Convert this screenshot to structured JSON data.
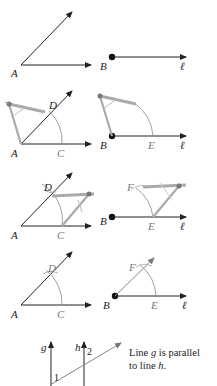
{
  "diagram": {
    "steps": [
      {
        "step": 1,
        "left": {
          "vertex": "A",
          "description": "Given angle A"
        },
        "right": {
          "point": "B",
          "line": "ℓ",
          "description": "Point B on line ℓ"
        }
      },
      {
        "step": 2,
        "left": {
          "labels": [
            "A",
            "C",
            "D"
          ],
          "description": "Compass arc centered at A intersecting rays at C and D"
        },
        "right": {
          "labels": [
            "B",
            "E",
            "ℓ"
          ],
          "description": "Same arc centered at B intersecting ℓ at E"
        }
      },
      {
        "step": 3,
        "left": {
          "labels": [
            "A",
            "C",
            "D"
          ],
          "description": "Compass measures distance from C to D"
        },
        "right": {
          "labels": [
            "B",
            "E",
            "F",
            "ℓ"
          ],
          "description": "Arc centered at E with radius CD intersects first arc at F"
        }
      },
      {
        "step": 4,
        "left": {
          "labels": [
            "A",
            "C",
            "D"
          ],
          "description": "Original angle with arcs"
        },
        "right": {
          "labels": [
            "B",
            "E",
            "F",
            "ℓ"
          ],
          "description": "Ray BF drawn; angle FBE congruent to angle DAC"
        }
      }
    ],
    "labels": {
      "A": "A",
      "B": "B",
      "C": "C",
      "D": "D",
      "E": "E",
      "F": "F",
      "ell": "ℓ",
      "g": "g",
      "h": "h",
      "one": "1",
      "two": "2"
    },
    "caption": {
      "line1_pre": "Line ",
      "line1_var": "g",
      "line1_post": " is parallel",
      "line2_pre": "to line ",
      "line2_var": "h",
      "line2_post": "."
    },
    "colors": {
      "ink": "#222222",
      "construction": "#8a8a8a",
      "compass": "#9a9a9a"
    }
  }
}
